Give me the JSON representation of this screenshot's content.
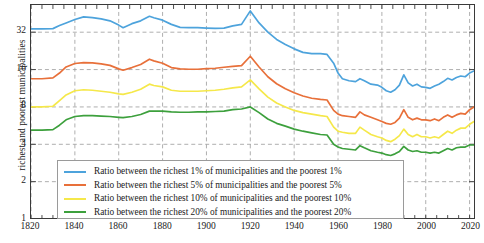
{
  "chart_data": {
    "type": "line",
    "title": "",
    "xlabel": "",
    "ylabel": "richest and poorest municipalities",
    "xlim": [
      1820,
      2022
    ],
    "ylim": [
      1,
      53
    ],
    "yscale": "log2",
    "grid": true,
    "legend_position": "lower center",
    "xticks": [
      1820,
      1840,
      1860,
      1880,
      1900,
      1920,
      1940,
      1960,
      1980,
      2000,
      2020
    ],
    "yticks": [
      1,
      2,
      4,
      8,
      16,
      32
    ],
    "minor_x_tick_step": 5,
    "colors": {
      "ratio_1": "#4da3dc",
      "ratio_5": "#e8703a",
      "ratio_10": "#f5e84a",
      "ratio_20": "#3da03d",
      "axis": "#3a3a3a",
      "grid": "#9a9a9a",
      "text": "#1a1a1a"
    },
    "x": [
      1820,
      1825,
      1830,
      1833,
      1836,
      1840,
      1844,
      1848,
      1852,
      1856,
      1860,
      1862,
      1866,
      1870,
      1874,
      1876,
      1880,
      1884,
      1888,
      1892,
      1896,
      1900,
      1904,
      1908,
      1912,
      1916,
      1920,
      1924,
      1928,
      1932,
      1936,
      1940,
      1944,
      1948,
      1952,
      1955,
      1958,
      1960,
      1962,
      1965,
      1968,
      1970,
      1972,
      1975,
      1978,
      1980,
      1982,
      1984,
      1986,
      1988,
      1990,
      1992,
      1994,
      1996,
      1998,
      2000,
      2002,
      2004,
      2006,
      2008,
      2010,
      2012,
      2014,
      2016,
      2018,
      2020,
      2022
    ],
    "series": [
      {
        "name": "Ratio between the richest 1% of municipalities and the poorest 1%",
        "color": "#4da3dc",
        "key": "ratio_1",
        "values": [
          34.0,
          34.0,
          34.2,
          36.2,
          38.0,
          40.5,
          42.5,
          42.0,
          41.0,
          39.5,
          36.5,
          34.8,
          37.5,
          39.5,
          43.0,
          41.8,
          40.0,
          37.0,
          35.0,
          34.8,
          34.8,
          34.5,
          34.3,
          34.5,
          36.0,
          37.0,
          47.5,
          38.0,
          32.0,
          28.0,
          25.5,
          23.5,
          22.0,
          21.5,
          21.5,
          21.2,
          18.0,
          15.0,
          13.5,
          13.0,
          12.8,
          13.5,
          13.0,
          12.2,
          12.0,
          11.5,
          10.8,
          10.5,
          11.0,
          12.0,
          14.5,
          12.5,
          11.8,
          12.2,
          11.6,
          11.5,
          11.3,
          11.8,
          12.2,
          12.8,
          13.6,
          13.2,
          13.8,
          14.2,
          14.0,
          15.0,
          15.6
        ]
      },
      {
        "name": "Ratio between the richest 5% of municipalities and the poorest 5%",
        "color": "#e8703a",
        "key": "ratio_5",
        "values": [
          13.5,
          13.5,
          13.7,
          15.0,
          16.8,
          17.9,
          18.2,
          18.1,
          17.8,
          17.3,
          16.2,
          15.8,
          16.6,
          17.6,
          19.4,
          18.8,
          18.0,
          16.6,
          16.2,
          16.1,
          16.1,
          16.3,
          16.4,
          16.7,
          17.0,
          17.2,
          20.5,
          16.8,
          14.0,
          12.3,
          11.2,
          10.4,
          9.8,
          9.4,
          9.2,
          9.1,
          7.5,
          7.0,
          6.8,
          6.7,
          6.6,
          7.3,
          6.9,
          6.6,
          6.3,
          6.1,
          5.9,
          5.8,
          6.0,
          6.5,
          7.6,
          6.6,
          6.3,
          6.5,
          6.3,
          6.3,
          6.2,
          6.4,
          6.2,
          6.6,
          6.9,
          6.6,
          6.9,
          7.1,
          7.0,
          7.6,
          8.0
        ]
      },
      {
        "name": "Ratio between the richest 10% of municipalities and the poorest 10%",
        "color": "#f5e84a",
        "key": "ratio_10",
        "values": [
          8.0,
          8.0,
          8.1,
          9.0,
          10.0,
          10.8,
          11.0,
          10.9,
          10.7,
          10.5,
          10.2,
          10.1,
          10.5,
          11.1,
          12.2,
          11.9,
          11.6,
          10.9,
          10.7,
          10.7,
          10.7,
          10.8,
          10.9,
          11.1,
          11.4,
          11.6,
          13.2,
          11.2,
          9.6,
          8.6,
          8.0,
          7.5,
          7.2,
          7.0,
          6.8,
          6.7,
          5.5,
          5.1,
          5.0,
          4.9,
          4.9,
          5.5,
          5.2,
          4.8,
          4.6,
          4.5,
          4.3,
          4.2,
          4.4,
          4.7,
          5.3,
          4.8,
          4.6,
          4.8,
          4.6,
          4.6,
          4.5,
          4.6,
          4.5,
          4.8,
          5.1,
          4.9,
          5.2,
          5.4,
          5.4,
          5.8,
          6.1
        ]
      },
      {
        "name": "Ratio between the richest 20% of municipalities and the poorest 20%",
        "color": "#3da03d",
        "key": "ratio_20",
        "values": [
          5.2,
          5.2,
          5.25,
          5.7,
          6.3,
          6.7,
          6.8,
          6.8,
          6.75,
          6.7,
          6.6,
          6.55,
          6.7,
          6.95,
          7.4,
          7.4,
          7.4,
          7.3,
          7.25,
          7.25,
          7.3,
          7.3,
          7.35,
          7.4,
          7.6,
          7.7,
          8.0,
          7.2,
          6.4,
          5.9,
          5.6,
          5.3,
          5.1,
          4.95,
          4.8,
          4.75,
          4.0,
          3.8,
          3.7,
          3.65,
          3.6,
          3.9,
          3.75,
          3.55,
          3.45,
          3.4,
          3.3,
          3.25,
          3.35,
          3.5,
          3.85,
          3.6,
          3.5,
          3.55,
          3.45,
          3.45,
          3.4,
          3.45,
          3.4,
          3.55,
          3.7,
          3.6,
          3.75,
          3.8,
          3.8,
          3.95,
          3.95
        ]
      }
    ]
  },
  "axis": {
    "ylabel": "richest and poorest municipalities",
    "yticks": [
      "32",
      "16",
      "8",
      "4",
      "2",
      "1"
    ],
    "xticks": [
      "1820",
      "1840",
      "1860",
      "1880",
      "1900",
      "1920",
      "1940",
      "1960",
      "1980",
      "2000",
      "2020"
    ]
  },
  "legend": {
    "items": [
      {
        "label": "Ratio between the richest 1% of municipalities and the poorest 1%",
        "color": "#4da3dc"
      },
      {
        "label": "Ratio between the richest 5% of municipalities and the poorest 5%",
        "color": "#e8703a"
      },
      {
        "label": "Ratio between the richest 10% of municipalities and the poorest 10%",
        "color": "#f5e84a"
      },
      {
        "label": "Ratio between the richest 20% of municipalities and the poorest 20%",
        "color": "#3da03d"
      }
    ]
  }
}
